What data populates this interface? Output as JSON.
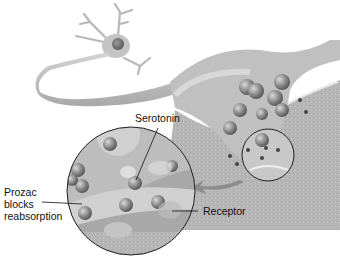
{
  "diagram": {
    "labels": {
      "serotonin": "Serotonin",
      "prozac_line1": "Prozac",
      "prozac_line2": "blocks",
      "prozac_line3": "reabsorption",
      "receptor": "Receptor"
    },
    "colors": {
      "background": "#ffffff",
      "neuron": "#c8c8c8",
      "postsynaptic": "#b4b4b4",
      "vesicle": "#8a8a8a",
      "outline": "#222222"
    }
  }
}
